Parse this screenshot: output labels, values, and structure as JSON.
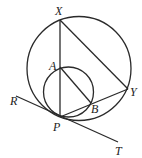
{
  "diagram": {
    "type": "geometry",
    "labels": {
      "X": "X",
      "Y": "Y",
      "A": "A",
      "B": "B",
      "P": "P",
      "R": "R",
      "T": "T"
    },
    "elements": [
      {
        "type": "circle",
        "name": "large-circle",
        "passes_through": [
          "X",
          "Y",
          "P"
        ]
      },
      {
        "type": "circle",
        "name": "small-circle",
        "center": "none labeled",
        "passes_through": [
          "A",
          "B",
          "P"
        ]
      },
      {
        "type": "segment",
        "from": "X",
        "to": "P"
      },
      {
        "type": "segment",
        "from": "X",
        "to": "Y"
      },
      {
        "type": "segment",
        "from": "P",
        "to": "Y"
      },
      {
        "type": "segment",
        "from": "A",
        "to": "B"
      },
      {
        "type": "line",
        "name": "tangent",
        "from": "R",
        "to": "T",
        "through": "P"
      }
    ]
  }
}
